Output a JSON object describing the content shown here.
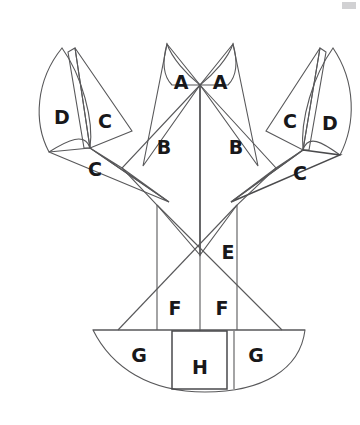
{
  "figure": {
    "title": "",
    "stroke_color": "#58585a",
    "label_color": "#18181a",
    "background_color": "#ffffff",
    "width": 360,
    "height": 425
  },
  "labels": [
    {
      "id": "a-left",
      "text": "A",
      "x": 181,
      "y": 83
    },
    {
      "id": "a-right",
      "text": "A",
      "x": 220,
      "y": 83
    },
    {
      "id": "b-left",
      "text": "B",
      "x": 164,
      "y": 148
    },
    {
      "id": "b-right",
      "text": "B",
      "x": 236,
      "y": 148
    },
    {
      "id": "c-left-upper",
      "text": "C",
      "x": 105,
      "y": 122
    },
    {
      "id": "c-left-lower",
      "text": "C",
      "x": 95,
      "y": 170
    },
    {
      "id": "c-right-upper",
      "text": "C",
      "x": 290,
      "y": 122
    },
    {
      "id": "c-right-lower",
      "text": "C",
      "x": 300,
      "y": 174
    },
    {
      "id": "d-left",
      "text": "D",
      "x": 62,
      "y": 118
    },
    {
      "id": "d-right",
      "text": "D",
      "x": 330,
      "y": 124
    },
    {
      "id": "e-center",
      "text": "E",
      "x": 228,
      "y": 253
    },
    {
      "id": "f-left",
      "text": "F",
      "x": 175,
      "y": 309
    },
    {
      "id": "f-right",
      "text": "F",
      "x": 222,
      "y": 309
    },
    {
      "id": "g-left",
      "text": "G",
      "x": 139,
      "y": 356
    },
    {
      "id": "g-right",
      "text": "G",
      "x": 256,
      "y": 356
    },
    {
      "id": "h-center",
      "text": "H",
      "x": 200,
      "y": 368
    }
  ],
  "outlines": {
    "antenna_left_petal": "M 62 48 C 36 80 33 122 49 152 C 68 140 85 132 90 148 C 94 120 82 76 62 48 Z",
    "antenna_left_triangle": "M 75 48 L 132 131 L 90 148 Z",
    "antenna_left_sliver": "M 75 48 L 90 148 L 84 148 L 68 52 Z",
    "claw_left_triangle": "M 90 148 L 49 152 L 169 202 Z",
    "claw_left_inner": "M 90 148 L 122 168 L 169 202 Z",
    "antenna_right_petal": "M 333 48 C 356 82 356 124 340 155 C 322 142 308 134 303 150 C 300 120 313 76 333 48 Z",
    "antenna_right_triangle": "M 320 48 L 266 131 L 303 150 Z",
    "antenna_right_sliver": "M 320 48 L 303 150 L 309 150 L 326 52 Z",
    "claw_right_triangle": "M 303 150 L 340 155 L 231 202 Z",
    "claw_right_inner": "M 303 150 L 276 168 L 231 202 Z",
    "head_left_petal": "M 200 85 C 186 74 172 58 167 44 C 162 62 163 76 172 85 Z",
    "head_right_petal": "M 200 85 C 214 74 228 58 233 44 C 238 62 237 76 228 85 Z",
    "head_left_spike": "M 167 44 L 200 85 L 143 166 Z",
    "head_right_spike": "M 233 44 L 200 85 L 258 166 Z",
    "body_left": "M 200 85 L 122 168 L 157 205 L 200 255 Z",
    "body_right": "M 200 85 L 276 168 L 237 205 L 200 255 Z",
    "mid_left_vertical": "M 157 205 L 157 330",
    "mid_right_vertical": "M 237 205 L 237 330",
    "center_vertical": "M 200 85 L 200 331",
    "cross_left_down": "M 157 205 L 282 330",
    "cross_right_down": "M 237 205 L 118 330",
    "tail_fan": "M 93 330 L 305 330 C 300 370 262 392 205 392 C 150 392 112 368 93 330 Z",
    "tail_top_edge": "M 93 330 L 305 330",
    "tail_h_rect": "M 172 331 L 227 331 L 227 389 L 172 389 Z",
    "tail_divider_right": "M 234 331 L 234 389"
  },
  "corner_mark": {
    "id": "corner-artifact",
    "color": "#c9c9cb"
  }
}
